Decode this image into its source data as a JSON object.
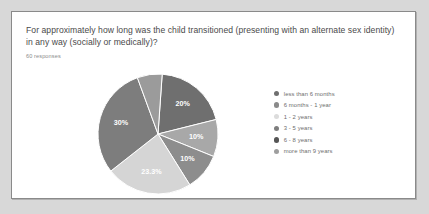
{
  "card": {
    "question": "For approximately how long was the child transitioned (presenting with an alternate sex identity) in any way (socially or medically)?",
    "responses": "60 responses"
  },
  "chart_data": {
    "type": "pie",
    "title": "For approximately how long was the child transitioned (presenting with an alternate sex identity) in any way (socially or medically)?",
    "subtitle": "60 responses",
    "legend_position": "right",
    "total_responses": 60,
    "categories": [
      "less than 6 months",
      "6 months - 1 year",
      "1 - 2 years",
      "3 - 5 years",
      "6 - 8 years",
      "more than 9 years"
    ],
    "values": [
      20,
      10,
      10,
      23.3,
      30,
      6.7
    ],
    "value_labels": [
      "20%",
      "10%",
      "10%",
      "23.3%",
      "30%",
      ""
    ],
    "colors": [
      "#6f6f6f",
      "#a8a8a8",
      "#8d8d8d",
      "#d5d5d5",
      "#7d7d7d",
      "#9b9b9b"
    ],
    "slices": [
      {
        "label": "less than 6 months",
        "value": 20,
        "display": "20%",
        "color": "#6f6f6f"
      },
      {
        "label": "6 months - 1 year",
        "value": 10,
        "display": "10%",
        "color": "#a8a8a8"
      },
      {
        "label": "1 - 2 years",
        "value": 10,
        "display": "10%",
        "color": "#8d8d8d"
      },
      {
        "label": "3 - 5 years",
        "value": 23.3,
        "display": "23.3%",
        "color": "#d5d5d5"
      },
      {
        "label": "6 - 8 years",
        "value": 30,
        "display": "30%",
        "color": "#7d7d7d"
      },
      {
        "label": "more than 9 years",
        "value": 6.7,
        "display": "",
        "color": "#9b9b9b"
      }
    ]
  },
  "legend": {
    "items": [
      {
        "label": "less than 6 months",
        "color": "#6f6f6f"
      },
      {
        "label": "6 months - 1 year",
        "color": "#8a8a8a"
      },
      {
        "label": "1 - 2 years",
        "color": "#dcdcdc"
      },
      {
        "label": "3 - 5 years",
        "color": "#7e7e7e"
      },
      {
        "label": "6 - 8 years",
        "color": "#555555"
      },
      {
        "label": "more than 9 years",
        "color": "#9e9e9e"
      }
    ]
  },
  "pie_labels": {
    "s0": "20%",
    "s1": "10%",
    "s2": "10%",
    "s3": "23.3%",
    "s4": "30%"
  }
}
